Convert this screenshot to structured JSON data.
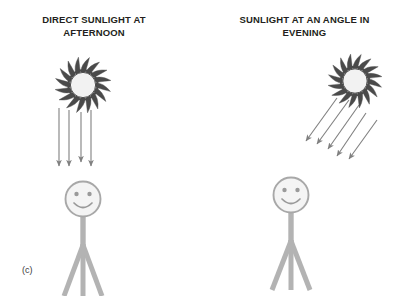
{
  "figure": {
    "caption": "(c)",
    "background_color": "#ffffff",
    "width": 406,
    "height": 296
  },
  "panels": [
    {
      "id": "afternoon",
      "title": "DIRECT SUNLIGHT AT\nAFTERNOON",
      "sun": {
        "icon": "sun-icon",
        "center_x": 83,
        "center_y": 85,
        "radius": 30,
        "ray_count": 16,
        "core_color": "#f2f2f2",
        "spike_color": "#4a4a4a"
      },
      "light_rays": {
        "icon": "down-arrow-icon",
        "direction": "vertical",
        "angle_degrees": 90,
        "count": 4,
        "color": "#808080",
        "x_positions": [
          59,
          69,
          81,
          91
        ],
        "y_start": 108,
        "y_ends": [
          167,
          167,
          163,
          167
        ]
      },
      "person": {
        "icon": "stick-figure-icon",
        "head_center_x": 83,
        "head_center_y": 199,
        "head_radius": 18,
        "body_bottom_y": 296,
        "color": "#b3b3b3",
        "face": {
          "eyes": 2,
          "mouth": "smile"
        }
      }
    },
    {
      "id": "evening",
      "title": "SUNLIGHT AT AN ANGLE IN\nEVENING",
      "sun": {
        "icon": "sun-icon",
        "center_x": 355,
        "center_y": 81,
        "radius": 29,
        "ray_count": 16,
        "core_color": "#f2f2f2",
        "spike_color": "#4a4a4a"
      },
      "light_rays": {
        "icon": "diagonal-arrow-icon",
        "direction": "diagonal",
        "angle_degrees": 50,
        "count": 5,
        "color": "#808080",
        "start_points": [
          [
            337,
            98
          ],
          [
            348,
            100
          ],
          [
            358,
            104
          ],
          [
            364,
            112
          ],
          [
            375,
            119
          ]
        ],
        "end_points": [
          [
            305,
            142
          ],
          [
            316,
            145
          ],
          [
            327,
            150
          ],
          [
            336,
            157
          ],
          [
            348,
            160
          ]
        ]
      },
      "person": {
        "icon": "stick-figure-icon",
        "head_center_x": 291,
        "head_center_y": 195,
        "head_radius": 18,
        "body_bottom_y": 290,
        "color": "#b3b3b3",
        "face": {
          "eyes": 2,
          "mouth": "smile"
        }
      }
    }
  ],
  "colors": {
    "text": "#231f20",
    "ray": "#808080",
    "figure": "#b3b3b3",
    "sun_outline": "#4a4a4a",
    "sun_core": "#f2f2f2"
  }
}
